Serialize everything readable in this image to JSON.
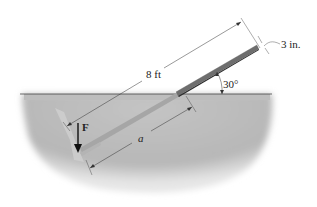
{
  "figure": {
    "type": "statics diagram",
    "labels": {
      "length": "8 ft",
      "thickness": "3 in.",
      "angle": "30°",
      "force": "F",
      "embedded_length": "a"
    },
    "colors": {
      "ground": "#bdbdbd",
      "ground_edge": "#d8d8d8",
      "bar_top": "#7a7a7a",
      "bar_dark": "#3a3a3a",
      "bar_buried": "#a8a8a8",
      "line": "#333333",
      "background": "#ffffff"
    }
  }
}
